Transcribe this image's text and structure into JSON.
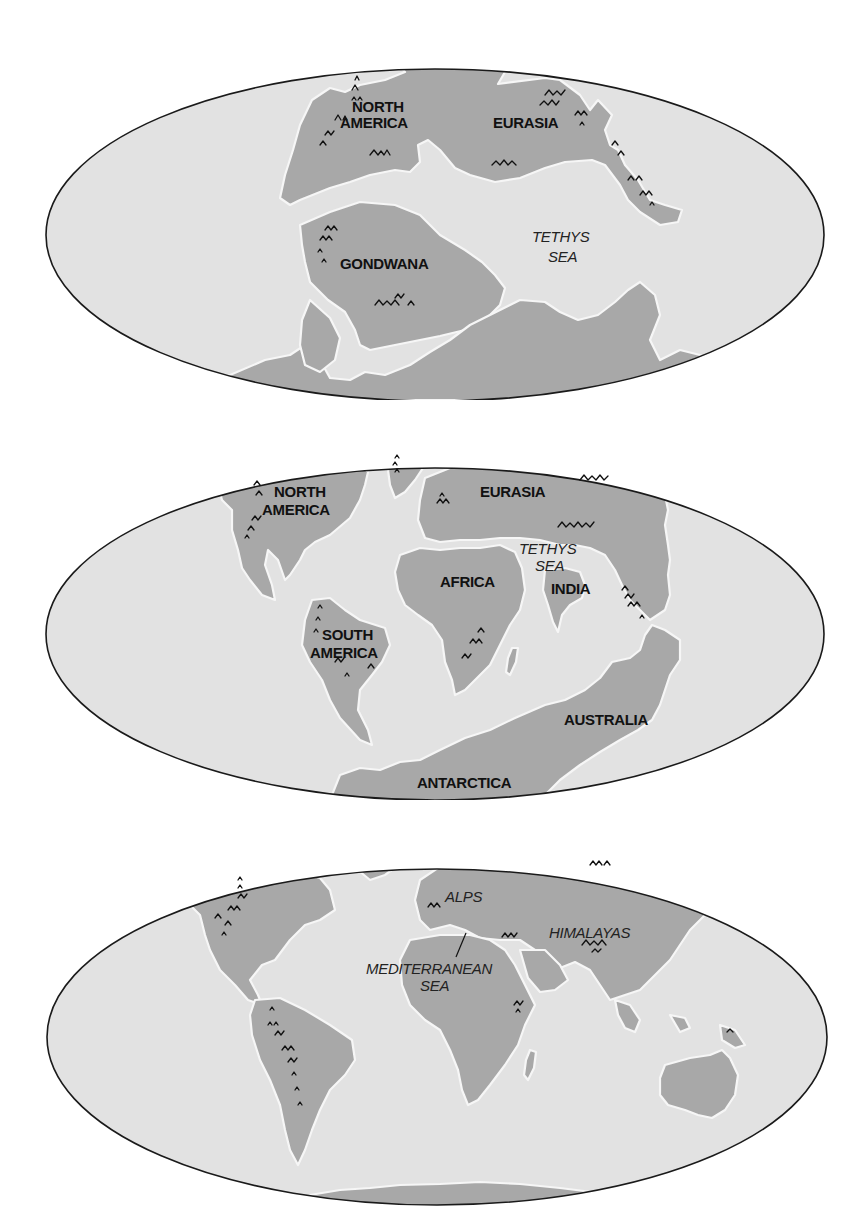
{
  "figure": {
    "colors": {
      "background": "#ffffff",
      "ocean": "#e2e2e2",
      "land": "#a8a8a8",
      "coast_halo": "#f6f6f6",
      "rim": "#1a1a1a",
      "text": "#111111"
    }
  },
  "panels": [
    {
      "id": "panel-1",
      "stage": "Pangaea era",
      "labels": {
        "north_america": [
          "NORTH",
          "AMERICA"
        ],
        "eurasia": "EURASIA",
        "gondwana": "GONDWANA",
        "tethys_sea": [
          "TETHYS",
          "SEA"
        ]
      }
    },
    {
      "id": "panel-2",
      "stage": "Breakup era",
      "labels": {
        "north_america": [
          "NORTH",
          "AMERICA"
        ],
        "eurasia": "EURASIA",
        "tethys_sea": [
          "TETHYS",
          "SEA"
        ],
        "africa": "AFRICA",
        "india": "INDIA",
        "south_america": [
          "SOUTH",
          "AMERICA"
        ],
        "australia": "AUSTRALIA",
        "antarctica": "ANTARCTICA"
      }
    },
    {
      "id": "panel-3",
      "stage": "Present day",
      "labels": {
        "alps": "ALPS",
        "himalayas": "HIMALAYAS",
        "mediterranean_sea": [
          "MEDITERRANEAN",
          "SEA"
        ]
      }
    }
  ],
  "icons": {
    "mountain_range": "mountain-range-icon"
  }
}
